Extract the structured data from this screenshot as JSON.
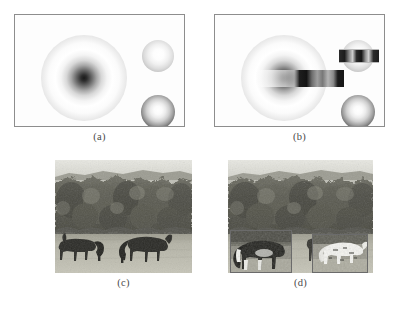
{
  "figure": {
    "type": "multi-panel-scientific-figure",
    "panel_count": 4,
    "background_color": "#ffffff",
    "arrangement": "2x2 grid"
  },
  "panels": [
    {
      "id": "a",
      "caption": "(a)",
      "kind": "synthetic",
      "frame": {
        "x": 14,
        "y": 14,
        "width": 171,
        "height": 113,
        "border_color": "#8d8d8d",
        "fill": "#fdfdfd"
      },
      "objects": [
        {
          "name": "large-sphere",
          "shape": "circle",
          "cx": 69,
          "cy": 63,
          "r": 43,
          "style": "dark-core-white-ring",
          "core_color": "#1a1a1a",
          "rim_color": "#9a9a9a"
        },
        {
          "name": "small-light-sphere",
          "shape": "circle",
          "cx": 143,
          "cy": 41,
          "r": 16,
          "style": "white-core-light-rim",
          "core_color": "#ffffff",
          "rim_color": "#989898"
        },
        {
          "name": "small-dark-sphere",
          "shape": "circle",
          "cx": 143,
          "cy": 97,
          "r": 17,
          "style": "white-core-dark-rim",
          "core_color": "#ffffff",
          "rim_color": "#1f1f1f"
        }
      ],
      "bars": []
    },
    {
      "id": "b",
      "caption": "(b)",
      "kind": "synthetic",
      "frame": {
        "x": 214,
        "y": 14,
        "width": 171,
        "height": 113,
        "border_color": "#8d8d8d",
        "fill": "#fdfdfd"
      },
      "objects": [
        {
          "name": "large-sphere",
          "shape": "circle",
          "cx": 69,
          "cy": 63,
          "r": 43,
          "style": "dark-core-white-ring",
          "core_color": "#1a1a1a",
          "rim_color": "#9a9a9a"
        },
        {
          "name": "small-light-sphere",
          "shape": "circle",
          "cx": 143,
          "cy": 41,
          "r": 16,
          "style": "white-core-light-rim",
          "core_color": "#ffffff",
          "rim_color": "#989898"
        },
        {
          "name": "small-dark-sphere",
          "shape": "circle",
          "cx": 143,
          "cy": 97,
          "r": 17,
          "style": "white-core-dark-rim",
          "core_color": "#ffffff",
          "rim_color": "#1f1f1f"
        }
      ],
      "bars": [
        {
          "name": "main-bar",
          "x": 40,
          "y": 55,
          "width": 89,
          "height": 17,
          "orientation": "horizontal",
          "dark_color": "#141414"
        },
        {
          "name": "small-bar",
          "x": 124,
          "y": 34,
          "width": 40,
          "height": 12,
          "orientation": "horizontal",
          "dark_color": "#1c1c1c"
        }
      ]
    },
    {
      "id": "c",
      "caption": "(c)",
      "kind": "photograph",
      "frame": {
        "x": 55,
        "y": 160,
        "width": 137,
        "height": 113
      },
      "subject": "two dark horses grazing in an open field with an autumn treeline",
      "colorspace": "grayscale",
      "insets": []
    },
    {
      "id": "d",
      "caption": "(d)",
      "kind": "photograph",
      "frame": {
        "x": 228,
        "y": 160,
        "width": 145,
        "height": 113
      },
      "subject": "same field scene with two highlighted detection regions around the horses",
      "colorspace": "grayscale",
      "insets": [
        {
          "name": "detection-inset-left",
          "x": 2,
          "y": 70,
          "width": 62,
          "height": 43,
          "border_color": "#6b6b6b",
          "content": "enlarged contrast-boosted crop of the left horse"
        },
        {
          "name": "detection-inset-right",
          "x": 84,
          "y": 74,
          "width": 56,
          "height": 39,
          "border_color": "#6b6b6b",
          "content": "enlarged contrast-boosted crop of the right horse"
        }
      ]
    }
  ],
  "captions": {
    "a": "(a)",
    "b": "(b)",
    "c": "(c)",
    "d": "(d)"
  },
  "colors": {
    "page_background": "#ffffff",
    "frame_border": "#8d8d8d",
    "caption_text": "#4a4a4a",
    "sky": "#e4e4de",
    "treeline_dark": "#4e4e46",
    "treeline_mid": "#73736a",
    "field_light": "#b9b8ac",
    "horse_body": "#2a2a26"
  }
}
